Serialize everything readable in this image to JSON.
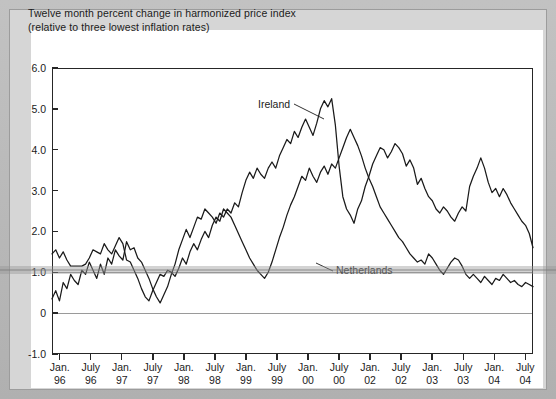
{
  "figure": {
    "title_line1": "Twelve month percent change in harmonized price index",
    "title_line2": "(relative to three lowest inflation rates)"
  },
  "chart_data": {
    "type": "line",
    "title": "Twelve month percent change in harmonized price index (relative to three lowest inflation rates)",
    "xlabel": "",
    "ylabel": "",
    "ylim": [
      -1.0,
      6.0
    ],
    "ytick_labels": [
      "6.0",
      "5.0",
      "4.0",
      "3.0",
      "2.0",
      "1.0",
      "0",
      "-1.0"
    ],
    "ytick_values": [
      6.0,
      5.0,
      4.0,
      3.0,
      2.0,
      1.0,
      0.0,
      -1.0
    ],
    "xtick_labels": [
      {
        "month": "Jan.",
        "year": "96"
      },
      {
        "month": "July",
        "year": "96"
      },
      {
        "month": "Jan.",
        "year": "97"
      },
      {
        "month": "July",
        "year": "97"
      },
      {
        "month": "Jan.",
        "year": "98"
      },
      {
        "month": "July",
        "year": "98"
      },
      {
        "month": "Jan.",
        "year": "99"
      },
      {
        "month": "July",
        "year": "99"
      },
      {
        "month": "Jan.",
        "year": "00"
      },
      {
        "month": "July",
        "year": "00"
      },
      {
        "month": "Jan.",
        "year": "02"
      },
      {
        "month": "July",
        "year": "02"
      },
      {
        "month": "Jan.",
        "year": "03"
      },
      {
        "month": "July",
        "year": "03"
      },
      {
        "month": "Jan.",
        "year": "04"
      },
      {
        "month": "July",
        "year": "04"
      }
    ],
    "grid": "horizontal gridlines at 1.0 and 0",
    "gridline_values": [
      1.0,
      0.0
    ],
    "legend_position": "inline annotations with leader lines",
    "annotations": [
      {
        "text": "Ireland",
        "points_to_value": 4.3
      },
      {
        "text": "Netherlands",
        "points_to_value": 1.0
      }
    ],
    "series": [
      {
        "name": "Ireland",
        "color": "#1a1a1a",
        "values": [
          0.35,
          0.55,
          0.3,
          0.75,
          0.6,
          0.95,
          0.8,
          0.7,
          1.05,
          0.95,
          1.25,
          1.05,
          0.85,
          1.2,
          0.95,
          1.35,
          1.2,
          1.55,
          1.4,
          1.3,
          1.75,
          1.55,
          1.6,
          1.35,
          1.25,
          1.05,
          0.85,
          0.6,
          0.4,
          0.25,
          0.45,
          0.65,
          0.95,
          1.2,
          1.55,
          1.8,
          2.05,
          1.85,
          2.1,
          2.35,
          2.3,
          2.55,
          2.45,
          2.35,
          2.2,
          2.45,
          2.35,
          2.55,
          2.45,
          2.7,
          2.6,
          2.95,
          3.25,
          3.45,
          3.3,
          3.55,
          3.4,
          3.3,
          3.55,
          3.7,
          3.55,
          3.85,
          4.05,
          4.25,
          4.15,
          4.45,
          4.3,
          4.55,
          4.75,
          4.55,
          4.35,
          4.65,
          5.0,
          5.2,
          5.05,
          5.25,
          4.6,
          3.6,
          2.85,
          2.55,
          2.4,
          2.2,
          2.55,
          2.75,
          3.1,
          3.35,
          3.65,
          3.85,
          4.05,
          4.0,
          3.8,
          3.95,
          4.15,
          4.05,
          3.9,
          3.6,
          3.75,
          3.55,
          3.15,
          3.3,
          3.05,
          2.85,
          2.75,
          2.55,
          2.45,
          2.6,
          2.5,
          2.35,
          2.25,
          2.45,
          2.6,
          2.5,
          3.1,
          3.35,
          3.55,
          3.8,
          3.55,
          3.2,
          2.95,
          3.05,
          2.85,
          3.05,
          2.9,
          2.7,
          2.55,
          2.4,
          2.25,
          2.15,
          1.95,
          1.6
        ]
      },
      {
        "name": "Netherlands",
        "color": "#1a1a1a",
        "values": [
          1.45,
          1.55,
          1.35,
          1.5,
          1.3,
          1.15,
          1.15,
          1.15,
          1.15,
          1.2,
          1.35,
          1.55,
          1.5,
          1.45,
          1.7,
          1.55,
          1.45,
          1.65,
          1.85,
          1.7,
          1.3,
          1.25,
          1.05,
          0.85,
          0.6,
          0.4,
          0.3,
          0.55,
          0.75,
          0.95,
          0.9,
          1.05,
          1.0,
          0.9,
          1.1,
          1.35,
          1.2,
          1.5,
          1.7,
          1.55,
          1.8,
          2.0,
          1.85,
          2.15,
          2.35,
          2.25,
          2.55,
          2.45,
          2.35,
          2.15,
          1.95,
          1.75,
          1.55,
          1.35,
          1.2,
          1.05,
          0.95,
          0.85,
          1.0,
          1.25,
          1.55,
          1.85,
          2.1,
          2.4,
          2.65,
          2.85,
          3.1,
          3.35,
          3.25,
          3.55,
          3.35,
          3.2,
          3.45,
          3.6,
          3.4,
          3.65,
          3.55,
          3.8,
          4.05,
          4.3,
          4.5,
          4.3,
          4.1,
          3.85,
          3.55,
          3.3,
          3.1,
          2.85,
          2.6,
          2.45,
          2.3,
          2.15,
          2.0,
          1.85,
          1.75,
          1.6,
          1.45,
          1.35,
          1.25,
          1.3,
          1.2,
          1.45,
          1.35,
          1.2,
          1.05,
          0.95,
          1.1,
          1.25,
          1.35,
          1.3,
          1.15,
          0.95,
          0.85,
          0.95,
          0.85,
          0.75,
          0.9,
          0.8,
          0.7,
          0.85,
          0.8,
          0.95,
          0.85,
          0.75,
          0.8,
          0.7,
          0.65,
          0.75,
          0.7,
          0.65
        ]
      }
    ]
  }
}
